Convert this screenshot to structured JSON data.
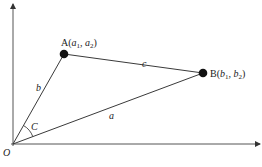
{
  "diagram": {
    "type": "vector-triangle",
    "colors": {
      "line": "#3a3a3a",
      "axis": "#555555",
      "point": "#111111",
      "text": "#222222"
    },
    "origin": {
      "label": "O",
      "x": 13,
      "y": 144
    },
    "axes": {
      "x_end": 261,
      "y_end": 3
    },
    "points": [
      {
        "id": "A",
        "label": "A(",
        "sub1": "a",
        "i1": "1",
        "sep": ", ",
        "sub2": "a",
        "i2": "2",
        "close": ")",
        "x": 64,
        "y": 54
      },
      {
        "id": "B",
        "label": "B(",
        "sub1": "b",
        "i1": "1",
        "sep": ", ",
        "sub2": "b",
        "i2": "2",
        "close": ")",
        "x": 203,
        "y": 73
      }
    ],
    "sides": {
      "a": {
        "label": "a",
        "from": "O",
        "to": "B"
      },
      "b": {
        "label": "b",
        "from": "O",
        "to": "A"
      },
      "c": {
        "label": "c",
        "from": "A",
        "to": "B"
      }
    },
    "angle": {
      "label": "C",
      "vertex": "O"
    }
  }
}
